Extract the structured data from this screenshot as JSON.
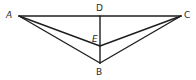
{
  "diagram": {
    "type": "geometry",
    "points": {
      "A": {
        "label": "A",
        "x": 19,
        "y": 16,
        "label_x": 6,
        "label_y": 18,
        "italic": true
      },
      "C": {
        "label": "C",
        "x": 181,
        "y": 16,
        "label_x": 184,
        "label_y": 18,
        "italic": false
      },
      "D": {
        "label": "D",
        "x": 100,
        "y": 16,
        "label_x": 96,
        "label_y": 11,
        "italic": false
      },
      "E": {
        "label": "E",
        "x": 100,
        "y": 46,
        "label_x": 92,
        "label_y": 42,
        "italic": true
      },
      "B": {
        "label": "B",
        "x": 100,
        "y": 63,
        "label_x": 96,
        "label_y": 75,
        "italic": false
      }
    },
    "segments": [
      [
        "A",
        "C"
      ],
      [
        "D",
        "B"
      ],
      [
        "A",
        "E"
      ],
      [
        "E",
        "C"
      ],
      [
        "A",
        "B"
      ],
      [
        "B",
        "C"
      ]
    ],
    "stroke_color": "#1e1e1e",
    "label_color": "#2a2a2a"
  }
}
